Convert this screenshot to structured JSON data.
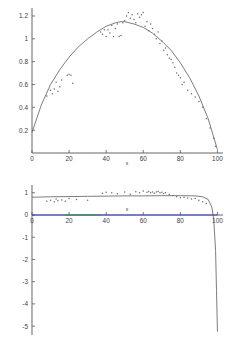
{
  "figure": {
    "background": "#ffffff",
    "curve_color": "#5a5a66",
    "point_color": "#6a6a78",
    "axis_color": "#55555f",
    "blue_color": "#3a3ad0",
    "green_color": "#2f9b2f"
  },
  "chart_data": [
    {
      "type": "scatter",
      "id": "top-plot",
      "title": "",
      "xlabel": "x",
      "ylabel": "",
      "xlim": [
        0,
        103
      ],
      "ylim": [
        0,
        1.27
      ],
      "grid": false,
      "legend": "none",
      "xticks": [
        0,
        20,
        40,
        60,
        80,
        100
      ],
      "xtick_labels": [
        "0",
        "20",
        "40",
        "60",
        "80",
        "100"
      ],
      "yticks": [
        0.2,
        0.4,
        0.6,
        0.8,
        1,
        1.2
      ],
      "ytick_labels": [
        "0.2",
        "0.4",
        "0.6",
        "0.8",
        "1",
        "1.2"
      ],
      "series": [
        {
          "name": "fitted-curve",
          "kind": "line",
          "comment": "smooth concave arc, peak ~1.15 near x=48, endpoints ~0.18 at x=0 and ~0.02 at x=100",
          "x": [
            0,
            5,
            10,
            15,
            20,
            25,
            30,
            35,
            40,
            45,
            48,
            50,
            55,
            60,
            65,
            70,
            75,
            80,
            85,
            90,
            95,
            100
          ],
          "y": [
            0.18,
            0.42,
            0.6,
            0.73,
            0.84,
            0.93,
            1.0,
            1.06,
            1.11,
            1.14,
            1.15,
            1.15,
            1.13,
            1.1,
            1.05,
            0.98,
            0.9,
            0.79,
            0.66,
            0.5,
            0.3,
            0.03
          ]
        },
        {
          "name": "observations",
          "kind": "points",
          "x": [
            8,
            10,
            11,
            12,
            13,
            14,
            15,
            16,
            19,
            20,
            21,
            22,
            37,
            38,
            39,
            40,
            41,
            42,
            43,
            44,
            45,
            46,
            47,
            48,
            49,
            50,
            51,
            52,
            53,
            54,
            55,
            56,
            57,
            58,
            59,
            60,
            61,
            62,
            63,
            64,
            65,
            66,
            67,
            68,
            69,
            70,
            71,
            72,
            73,
            74,
            75,
            76,
            77,
            78,
            79,
            80,
            81,
            82,
            84,
            86,
            88,
            90,
            92,
            94,
            96,
            98,
            99
          ],
          "y": [
            0.5,
            0.55,
            0.52,
            0.56,
            0.62,
            0.54,
            0.58,
            0.64,
            0.68,
            0.69,
            0.68,
            0.61,
            1.06,
            1.04,
            1.08,
            1.02,
            1.08,
            1.05,
            1.12,
            1.02,
            1.09,
            1.13,
            1.02,
            1.03,
            1.14,
            1.16,
            1.2,
            1.23,
            1.18,
            1.21,
            1.17,
            1.14,
            1.22,
            1.19,
            1.21,
            1.23,
            1.11,
            1.15,
            1.07,
            1.13,
            1.09,
            1.04,
            1.0,
            1.06,
            0.96,
            0.98,
            0.9,
            0.92,
            0.86,
            0.83,
            0.82,
            0.79,
            0.75,
            0.7,
            0.68,
            0.66,
            0.6,
            0.62,
            0.55,
            0.52,
            0.49,
            0.45,
            0.4,
            0.3,
            0.22,
            0.13,
            0.06
          ]
        }
      ]
    },
    {
      "type": "scatter",
      "id": "bottom-plot",
      "title": "",
      "xlabel": "x",
      "ylabel": "",
      "xlim": [
        0,
        103
      ],
      "ylim": [
        -5.4,
        1.35
      ],
      "grid": false,
      "legend": "none",
      "xticks": [
        0,
        20,
        40,
        60,
        80,
        100
      ],
      "xtick_labels": [
        "0",
        "20",
        "40",
        "60",
        "80",
        "100"
      ],
      "yticks": [
        1,
        0,
        -1,
        -2,
        -3,
        -4,
        -5
      ],
      "ytick_labels": [
        "1",
        "0",
        "-1",
        "-2",
        "-3",
        "-4",
        "-5"
      ],
      "series": [
        {
          "name": "log-curve",
          "kind": "line",
          "comment": "nearly flat near y=0.8 then plunges to -5.2 at x=100",
          "x": [
            0,
            5,
            10,
            20,
            30,
            40,
            50,
            60,
            70,
            80,
            88,
            92,
            95,
            97,
            98,
            99,
            99.5,
            100
          ],
          "y": [
            0.8,
            0.81,
            0.82,
            0.83,
            0.84,
            0.85,
            0.86,
            0.86,
            0.87,
            0.87,
            0.86,
            0.82,
            0.7,
            0.35,
            -0.2,
            -1.6,
            -3.4,
            -5.25
          ]
        },
        {
          "name": "observations",
          "kind": "points",
          "x": [
            8,
            10,
            12,
            13,
            14,
            16,
            18,
            20,
            24,
            30,
            38,
            40,
            43,
            46,
            50,
            53,
            56,
            58,
            60,
            62,
            63,
            64,
            65,
            66,
            67,
            68,
            69,
            70,
            71,
            72,
            74,
            76,
            78,
            80,
            82,
            84,
            86,
            88,
            90,
            92,
            94
          ],
          "y": [
            0.62,
            0.66,
            0.6,
            0.72,
            0.64,
            0.68,
            0.62,
            0.74,
            0.7,
            0.66,
            0.98,
            1.02,
            1.0,
            0.96,
            1.04,
            0.93,
            1.05,
            1.0,
            1.08,
            1.02,
            1.06,
            1.0,
            1.04,
            0.98,
            1.03,
            1.06,
            1.0,
            1.02,
            0.97,
            1.0,
            0.92,
            0.88,
            0.82,
            0.78,
            0.8,
            0.76,
            0.72,
            0.74,
            0.66,
            0.6,
            0.52
          ]
        },
        {
          "name": "zero-line-blue",
          "kind": "hline",
          "y": 0,
          "x_start": 0,
          "x_end": 100,
          "color": "#3a3ad0"
        },
        {
          "name": "zero-line-green",
          "kind": "hline",
          "y": 0,
          "x_start": 17,
          "x_end": 37,
          "color": "#2f9b2f"
        }
      ]
    }
  ]
}
